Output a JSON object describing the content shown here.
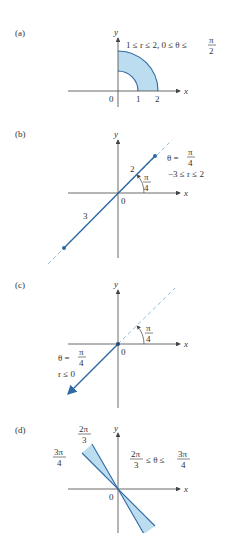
{
  "colors": {
    "curve": "#2f6aa3",
    "fill": "#bcdcf0",
    "dashed": "#8fc0e0",
    "axis": "#444444",
    "text": "#333333"
  },
  "panels": [
    {
      "label": "(a)",
      "axis_x": "x",
      "axis_y": "y",
      "origin": "0",
      "ticks": [
        "1",
        "2"
      ],
      "condition_left": "1 ≤ r ≤ 2, 0 ≤ θ ≤",
      "condition_num": "π",
      "condition_den": "2",
      "region": "annulus quarter 1≤r≤2, 0≤θ≤π/2"
    },
    {
      "label": "(b)",
      "axis_x": "x",
      "axis_y": "y",
      "origin": "0",
      "seg_label_pos": "2",
      "seg_label_neg": "3",
      "angle_num": "π",
      "angle_den": "4",
      "cond_theta": "θ =",
      "cond_theta_num": "π",
      "cond_theta_den": "4",
      "cond_r": "−3 ≤ r ≤ 2"
    },
    {
      "label": "(c)",
      "axis_x": "x",
      "axis_y": "y",
      "origin": "0",
      "angle_num": "π",
      "angle_den": "4",
      "cond_theta": "θ =",
      "cond_theta_num": "π",
      "cond_theta_den": "4",
      "cond_r": "r ≤ 0"
    },
    {
      "label": "(d)",
      "axis_x": "x",
      "axis_y": "y",
      "origin": "0",
      "ray1_num": "2π",
      "ray1_den": "3",
      "ray2_num": "3π",
      "ray2_den": "4",
      "cond_left_num": "2π",
      "cond_left_den": "3",
      "cond_mid": "≤ θ ≤",
      "cond_right_num": "3π",
      "cond_right_den": "4"
    }
  ]
}
